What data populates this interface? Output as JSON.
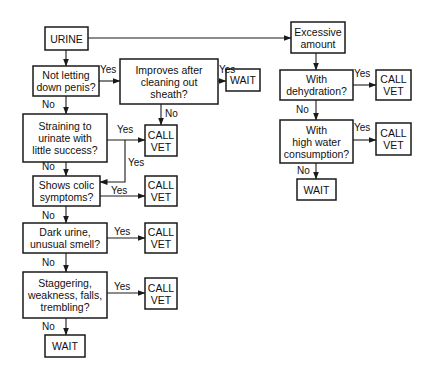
{
  "diagram": {
    "type": "flowchart",
    "nodes": {
      "urine": [
        "URINE"
      ],
      "not_letting_down": [
        "Not letting",
        "down penis?"
      ],
      "improves_after": [
        "Improves after",
        "cleaning out",
        "sheath?"
      ],
      "wait_top": [
        "WAIT"
      ],
      "call_vet_1": [
        "CALL",
        "VET"
      ],
      "straining": [
        "Straining to",
        "urinate with",
        "little success?"
      ],
      "colic": [
        "Shows colic",
        "symptoms?"
      ],
      "call_vet_2": [
        "CALL",
        "VET"
      ],
      "dark_urine": [
        "Dark urine,",
        "unusual smell?"
      ],
      "call_vet_3": [
        "CALL",
        "VET"
      ],
      "staggering": [
        "Staggering,",
        "weakness, falls,",
        "trembling?"
      ],
      "call_vet_4": [
        "CALL",
        "VET"
      ],
      "wait_bottom": [
        "WAIT"
      ],
      "excessive": [
        "Excessive",
        "amount"
      ],
      "dehydration": [
        "With",
        "dehydration?"
      ],
      "call_vet_r1": [
        "CALL",
        "VET"
      ],
      "high_water": [
        "With",
        "high water",
        "consumption?"
      ],
      "call_vet_r2": [
        "CALL",
        "VET"
      ],
      "wait_right": [
        "WAIT"
      ]
    },
    "edges": [
      {
        "from": "urine",
        "to": "not_letting_down",
        "label": ""
      },
      {
        "from": "urine",
        "to": "excessive",
        "label": ""
      },
      {
        "from": "not_letting_down",
        "to": "improves_after",
        "label": "Yes"
      },
      {
        "from": "not_letting_down",
        "to": "straining",
        "label": "No"
      },
      {
        "from": "improves_after",
        "to": "wait_top",
        "label": "Yes"
      },
      {
        "from": "improves_after",
        "to": "call_vet_1",
        "label": "No"
      },
      {
        "from": "straining",
        "to": "call_vet_1",
        "label": "Yes"
      },
      {
        "from": "straining",
        "to": "colic",
        "label": "Yes"
      },
      {
        "from": "straining",
        "to": "colic",
        "label": "No"
      },
      {
        "from": "colic",
        "to": "call_vet_2",
        "label": "Yes"
      },
      {
        "from": "colic",
        "to": "dark_urine",
        "label": "No"
      },
      {
        "from": "dark_urine",
        "to": "call_vet_3",
        "label": "Yes"
      },
      {
        "from": "dark_urine",
        "to": "staggering",
        "label": "No"
      },
      {
        "from": "staggering",
        "to": "call_vet_4",
        "label": "Yes"
      },
      {
        "from": "staggering",
        "to": "wait_bottom",
        "label": "No"
      },
      {
        "from": "excessive",
        "to": "dehydration",
        "label": ""
      },
      {
        "from": "dehydration",
        "to": "call_vet_r1",
        "label": "Yes"
      },
      {
        "from": "dehydration",
        "to": "high_water",
        "label": "No"
      },
      {
        "from": "high_water",
        "to": "call_vet_r2",
        "label": "Yes"
      },
      {
        "from": "high_water",
        "to": "wait_right",
        "label": "No"
      }
    ],
    "labels": {
      "yes": "Yes",
      "no": "No"
    }
  }
}
